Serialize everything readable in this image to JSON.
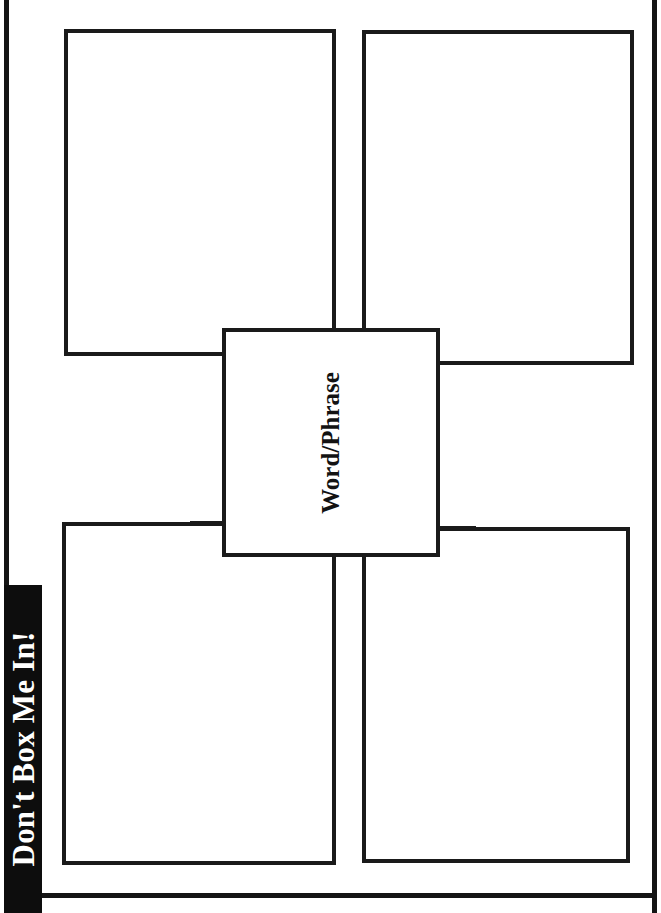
{
  "worksheet": {
    "title": "Don't Box Me In!",
    "type": "graphic-organizer",
    "center": {
      "label": "Word/Phrase",
      "value": "",
      "placeholder": ""
    },
    "boxes": [
      {
        "id": "top-left",
        "label": "",
        "value": "",
        "placeholder": ""
      },
      {
        "id": "top-right",
        "label": "",
        "value": "",
        "placeholder": ""
      },
      {
        "id": "bottom-left",
        "label": "",
        "value": "",
        "placeholder": ""
      },
      {
        "id": "bottom-right",
        "label": "",
        "value": "",
        "placeholder": ""
      }
    ],
    "colors": {
      "ink": "#1a1a1a",
      "banner_background": "#0d0d0d",
      "banner_text": "#ffffff",
      "page_background": "#ffffff"
    }
  }
}
